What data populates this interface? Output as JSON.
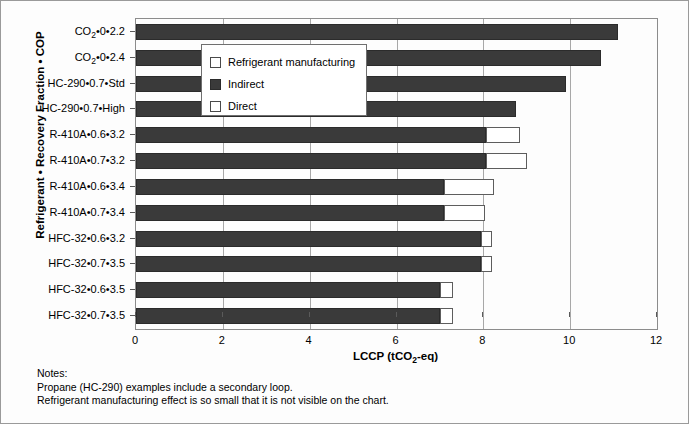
{
  "chart_data": {
    "type": "bar",
    "orientation": "horizontal",
    "stacked": true,
    "title": "",
    "xlabel": "LCCP (tCO2-eq)",
    "ylabel": "Refrigerant • Recovery Fraction • COP",
    "xlim": [
      0,
      12
    ],
    "xticks": [
      0,
      2,
      4,
      6,
      8,
      10,
      12
    ],
    "xticklabels": [
      "0",
      "2",
      "4",
      "6",
      "8",
      "10",
      "12"
    ],
    "grid": true,
    "grid_axis": "x",
    "legend_position": "upper-left-inside",
    "legend": [
      "Refrigerant manufacturing",
      "Indirect",
      "Direct"
    ],
    "series": [
      {
        "name": "Refrigerant manufacturing",
        "color": "#ffffff",
        "values": [
          0,
          0,
          0,
          0,
          0,
          0,
          0,
          0,
          0,
          0,
          0,
          0
        ]
      },
      {
        "name": "Indirect",
        "color": "#3a3a3a",
        "values": [
          11.1,
          10.7,
          9.9,
          8.75,
          8.05,
          8.05,
          7.1,
          7.1,
          7.95,
          7.95,
          7.0,
          7.0
        ]
      },
      {
        "name": "Direct",
        "color": "#ffffff",
        "values": [
          0,
          0,
          0,
          0,
          0.8,
          0.95,
          1.15,
          0.95,
          0.25,
          0.25,
          0.3,
          0.3
        ]
      }
    ],
    "categories": [
      "CO2•0•2.2",
      "CO2•0•2.4",
      "HC-290•0.7•Std",
      "HC-290•0.7•High",
      "R-410A•0.6•3.2",
      "R-410A•0.7•3.2",
      "R-410A•0.6•3.4",
      "R-410A•0.7•3.4",
      "HFC-32•0.6•3.2",
      "HFC-32•0.7•3.5",
      "HFC-32•0.6•3.5",
      "HFC-32•0.7•3.5"
    ],
    "category_labels_html": [
      "CO<sub>2</sub>•0•2.2",
      "CO<sub>2</sub>•0•2.4",
      "HC-290•0.7•Std",
      "HC-290•0.7•High",
      "R-410A•0.6•3.2",
      "R-410A•0.7•3.2",
      "R-410A•0.6•3.4",
      "R-410A•0.7•3.4",
      "HFC-32•0.6•3.2",
      "HFC-32•0.7•3.5",
      "HFC-32•0.6•3.5",
      "HFC-32•0.7•3.5"
    ],
    "totals": [
      11.1,
      10.7,
      9.9,
      8.75,
      8.85,
      9.0,
      8.25,
      8.05,
      8.2,
      8.2,
      7.3,
      7.3
    ]
  },
  "axes": {
    "x_title_prefix": "LCCP (tCO",
    "x_title_sub": "2",
    "x_title_suffix": "-eq)",
    "y_title": "Refrigerant • Recovery Fraction • COP"
  },
  "legend": {
    "items": [
      {
        "label": "Refrigerant manufacturing",
        "swatch": "white-square"
      },
      {
        "label": "Indirect",
        "swatch": "dark-square"
      },
      {
        "label": "Direct",
        "swatch": "white-square"
      }
    ]
  },
  "notes": {
    "heading": "Notes:",
    "lines": [
      "Propane (HC-290) examples include a secondary loop.",
      "Refrigerant manufacturing effect is so small that it is not visible on the chart."
    ]
  },
  "colors": {
    "indirect": "#3a3a3a",
    "direct": "#ffffff",
    "manufacturing": "#ffffff",
    "axis": "#8c8c8c",
    "grid": "#a8a8a8",
    "frame": "#9a9a9a",
    "background": "#fdfdfd"
  }
}
